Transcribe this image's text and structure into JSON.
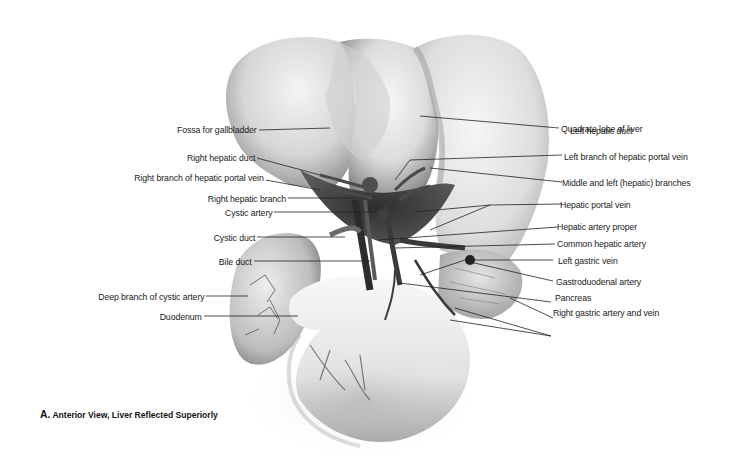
{
  "figure": {
    "caption_letter": "A.",
    "caption_text": "Anterior View, Liver Reflected Superiorly",
    "palette": {
      "background": "#ffffff",
      "organ_light": "#ededed",
      "organ_mid": "#bdbdbd",
      "organ_dark": "#6a6a6a",
      "vessel": "#3a3a3a",
      "leader_line": "#222222",
      "text": "#1a1a1a"
    }
  },
  "labels_left": [
    {
      "text": "Fossa for gallbladder"
    },
    {
      "text": "Right hepatic duct"
    },
    {
      "text": "Right branch of hepatic portal vein"
    },
    {
      "text": "Right hepatic branch"
    },
    {
      "text": "Cystic artery"
    },
    {
      "text": "Cystic duct"
    },
    {
      "text": "Bile duct"
    },
    {
      "text": "Deep branch of cystic artery"
    },
    {
      "text": "Duodenum"
    }
  ],
  "labels_right": [
    {
      "text": "Quadrate lobe of liver"
    },
    {
      "text": "Left hepatic duct"
    },
    {
      "text": "Left branch of hepatic portal vein"
    },
    {
      "text": "Middle and left (hepatic) branches"
    },
    {
      "text": "Hepatic portal vein"
    },
    {
      "text": "Hepatic artery proper"
    },
    {
      "text": "Common hepatic artery"
    },
    {
      "text": "Left gastric vein"
    },
    {
      "text": "Gastroduodenal artery"
    },
    {
      "text": "Pancreas"
    },
    {
      "text": "Right gastric artery and vein"
    }
  ]
}
